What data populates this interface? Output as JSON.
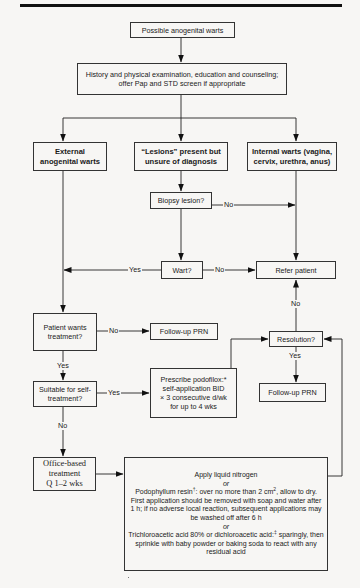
{
  "flowchart": {
    "start": "Possible anogenital warts",
    "history": "History and physical examination, education and counseling; offer Pap and STD screen if appropriate",
    "branches": {
      "external": "External anogenital warts",
      "lesions": "“Lesions” present but unsure of diagnosis",
      "internal": "Internal warts (vagina, cervix, urethra, anus)"
    },
    "biopsy": "Biopsy lesion?",
    "wart": "Wart?",
    "refer": "Refer patient",
    "patient_wants": "Patient wants treatment?",
    "followup_1": "Follow-up PRN",
    "resolution": "Resolution?",
    "followup_2": "Follow-up PRN",
    "suitable": "Suitable for self-treatment?",
    "prescribe": {
      "line1": "Prescribe podofilox:*",
      "line2": "self-application BID",
      "line3": "× 3 consecutive d/wk",
      "line4": "for up to 4 wks"
    },
    "office": {
      "line1": "Office-based",
      "line2": "treatment",
      "line3": "Q 1–2 wks"
    },
    "office_options": {
      "option1": "Apply liquid nitrogen",
      "or1": "or",
      "option2_name": "Podophyllum resin",
      "option2_mark": "†",
      "option2_text_a": ": over no more than 2 cm",
      "option2_sup": "2",
      "option2_text_b": ", allow to dry. First application should be removed with soap and water after 1 h; if no adverse local reaction, subsequent applications may be washed off after 6 h",
      "or2": "or",
      "option3_name": "Trichloroacetic acid 80% or dichloroacetic acid:",
      "option3_mark": "‡",
      "option3_text": "sparingly, then sprinkle with baby powder or baking soda to react with any residual acid"
    },
    "edge_labels": {
      "biopsy_no": "No",
      "wart_yes": "Yes",
      "wart_no": "No",
      "wants_no": "No",
      "wants_yes": "Yes",
      "resolution_no": "No",
      "resolution_yes": "Yes",
      "suitable_yes": "Yes",
      "suitable_no": "No"
    }
  }
}
